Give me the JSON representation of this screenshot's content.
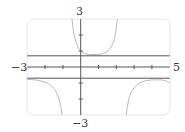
{
  "chart_data": {
    "type": "line",
    "title": "",
    "xlabel": "",
    "ylabel": "",
    "xlim": [
      -3,
      5
    ],
    "ylim": [
      -3,
      3
    ],
    "x_tick_labels": {
      "min": "−3",
      "max": "5"
    },
    "y_tick_labels": {
      "min": "−3",
      "max": "3"
    },
    "x_ticks": [
      -2,
      -1,
      1,
      2,
      3,
      4
    ],
    "y_ticks": [
      -2,
      -1,
      1,
      2
    ],
    "grid": false,
    "horizontal_lines": [
      0.7,
      -0.7
    ],
    "series": [
      {
        "name": "upper-branch",
        "points": [
          [
            -0.49,
            3
          ],
          [
            -0.4,
            2.2
          ],
          [
            -0.3,
            1.7
          ],
          [
            -0.15,
            1.25
          ],
          [
            0,
            1.0
          ],
          [
            0.3,
            0.82
          ],
          [
            0.6,
            0.78
          ],
          [
            0.9,
            0.78
          ],
          [
            1.2,
            0.82
          ],
          [
            1.5,
            0.98
          ],
          [
            1.7,
            1.25
          ],
          [
            1.85,
            1.6
          ],
          [
            1.95,
            2.1
          ],
          [
            2.06,
            3
          ]
        ]
      },
      {
        "name": "lower-left-branch",
        "points": [
          [
            -3,
            -0.78
          ],
          [
            -2.6,
            -0.8
          ],
          [
            -2.2,
            -0.88
          ],
          [
            -1.8,
            -1.05
          ],
          [
            -1.5,
            -1.35
          ],
          [
            -1.3,
            -1.75
          ],
          [
            -1.15,
            -2.3
          ],
          [
            -1.05,
            -3
          ]
        ]
      },
      {
        "name": "lower-right-branch",
        "points": [
          [
            2.55,
            -3
          ],
          [
            2.65,
            -2.3
          ],
          [
            2.8,
            -1.7
          ],
          [
            3.0,
            -1.3
          ],
          [
            3.3,
            -1.0
          ],
          [
            3.7,
            -0.85
          ],
          [
            4.2,
            -0.8
          ],
          [
            4.6,
            -0.82
          ],
          [
            4.85,
            -0.9
          ],
          [
            5,
            -1.0
          ]
        ]
      }
    ]
  },
  "colors": {
    "axis": "#555555",
    "curve": "#b8b8b8",
    "hline": "#555555",
    "frame": "#e6e6e6",
    "label": "#333333"
  }
}
